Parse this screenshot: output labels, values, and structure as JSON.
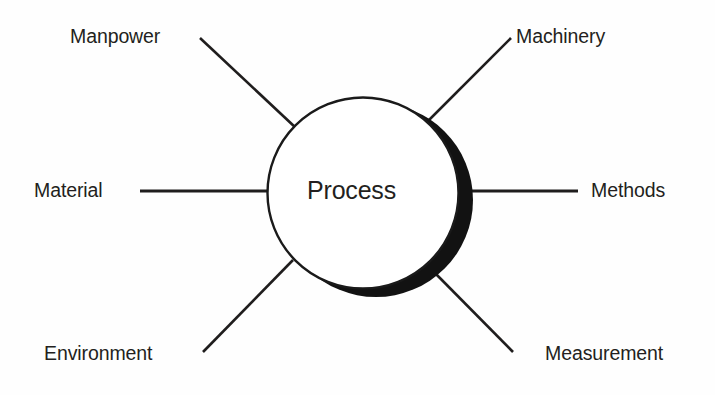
{
  "diagram": {
    "type": "spoke-diagram",
    "title_hub": "Process",
    "background_color": "#fefefe",
    "ink_color": "#231f20",
    "hub": {
      "label": "Process",
      "shape": "circle",
      "center_x": 363,
      "center_y": 193,
      "radius": 97,
      "fill": "#ffffff",
      "stroke": "#1a1a1a",
      "stroke_width": 2.4,
      "shadow": {
        "style": "thick-crescent",
        "side": "right-bottom-right",
        "color": "#121212",
        "offset_x": 13,
        "offset_y": 7
      }
    },
    "spokes": [
      {
        "id": "manpower",
        "label": "Manpower",
        "direction": "northwest",
        "orientation": "diagonal",
        "x1": 200,
        "y1": 38,
        "x2": 294,
        "y2": 126
      },
      {
        "id": "machinery",
        "label": "Machinery",
        "direction": "northeast",
        "orientation": "diagonal",
        "x1": 511,
        "y1": 38,
        "x2": 424,
        "y2": 125
      },
      {
        "id": "material",
        "label": "Material",
        "direction": "west",
        "orientation": "horizontal",
        "x1": 140,
        "y1": 191,
        "x2": 268,
        "y2": 191
      },
      {
        "id": "methods",
        "label": "Methods",
        "direction": "east",
        "orientation": "horizontal",
        "x1": 455,
        "y1": 191,
        "x2": 578,
        "y2": 191
      },
      {
        "id": "environment",
        "label": "Environment",
        "direction": "southwest",
        "orientation": "diagonal",
        "x1": 203,
        "y1": 352,
        "x2": 291,
        "y2": 262
      },
      {
        "id": "measurement",
        "label": "Measurement",
        "direction": "southeast",
        "orientation": "diagonal",
        "x1": 513,
        "y1": 352,
        "x2": 433,
        "y2": 271
      }
    ],
    "labels": {
      "manpower": "Manpower",
      "machinery": "Machinery",
      "material": "Material",
      "methods": "Methods",
      "environment": "Environment",
      "measurement": "Measurement",
      "process": "Process"
    }
  }
}
